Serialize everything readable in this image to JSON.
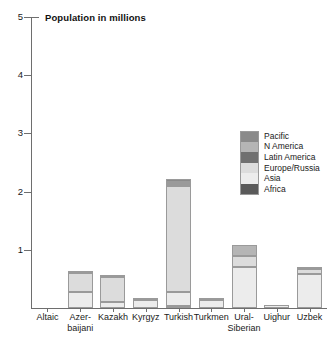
{
  "chart_data": {
    "type": "bar",
    "stacked": true,
    "title": "Population in millions",
    "xlabel": "",
    "ylabel": "",
    "ylim": [
      0,
      5
    ],
    "yticks": [
      1,
      2,
      3,
      4,
      5
    ],
    "ytick_labels": [
      "1",
      "2",
      "3",
      "4",
      "5"
    ],
    "grid": false,
    "legend_position": "inside-right",
    "categories": [
      "Altaic",
      "Azer-\nbaijani",
      "Kazakh",
      "Kyrgyz",
      "Turkish",
      "Turkmen",
      "Ural-\nSiberian",
      "Uighur",
      "Uzbek"
    ],
    "category_names": [
      "Altaic",
      "Azerbaijani",
      "Kazakh",
      "Kyrgyz",
      "Turkish",
      "Turkmen",
      "Ural-Siberian",
      "Uighur",
      "Uzbek"
    ],
    "series": [
      {
        "name": "Africa",
        "color": "#5a5a5a",
        "values": [
          0,
          0,
          0,
          0,
          0.04,
          0,
          0,
          0,
          0
        ]
      },
      {
        "name": "Asia",
        "color": "#ececec",
        "values": [
          0,
          0.28,
          0.1,
          0.14,
          0.24,
          0.13,
          0.7,
          0.06,
          0.58
        ]
      },
      {
        "name": "Europe/Russia",
        "color": "#dcdcdc",
        "values": [
          0,
          0.33,
          0.43,
          0.02,
          1.81,
          0.02,
          0.2,
          0.0,
          0.09
        ]
      },
      {
        "name": "Latin America",
        "color": "#707070",
        "values": [
          0,
          0,
          0,
          0,
          0.04,
          0,
          0,
          0,
          0
        ]
      },
      {
        "name": "N America",
        "color": "#b5b5b5",
        "values": [
          0,
          0.02,
          0.02,
          0.0,
          0.04,
          0.0,
          0.19,
          0.0,
          0.03
        ]
      },
      {
        "name": "Pacific",
        "color": "#8a8a8a",
        "values": [
          0,
          0,
          0,
          0,
          0.04,
          0,
          0,
          0,
          0
        ]
      }
    ],
    "totals": [
      0,
      0.63,
      0.55,
      0.16,
      2.21,
      0.15,
      1.09,
      0.06,
      0.7
    ],
    "legend_order": [
      "Pacific",
      "N America",
      "Latin America",
      "Europe/Russia",
      "Asia",
      "Africa"
    ],
    "legend_colors": [
      "#8a8a8a",
      "#b5b5b5",
      "#707070",
      "#dcdcdc",
      "#ececec",
      "#5a5a5a"
    ]
  }
}
